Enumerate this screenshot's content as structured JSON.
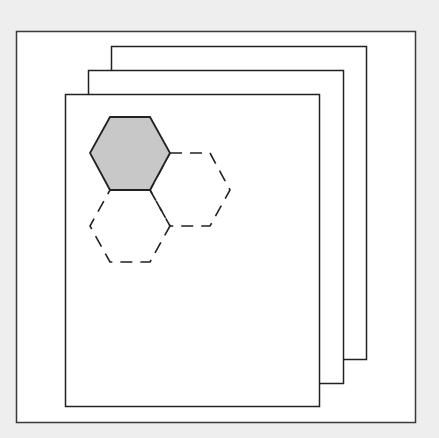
{
  "illustration": {
    "subject": "stacked-pages-with-hexagon-pattern",
    "colors": {
      "background": "#eeeeee",
      "paper": "#ffffff",
      "stroke": "#2a2a2a",
      "hex_fill": "#c8c8c8"
    },
    "frame": {
      "x": 16,
      "y": 31,
      "width": 399,
      "height": 391
    },
    "pages": [
      {
        "name": "back",
        "x": 111,
        "y": 46,
        "width": 255,
        "height": 313
      },
      {
        "name": "middle",
        "x": 88,
        "y": 70,
        "width": 255,
        "height": 313
      },
      {
        "name": "front",
        "x": 65,
        "y": 94,
        "width": 254,
        "height": 312
      }
    ],
    "hexagons": [
      {
        "name": "filled",
        "style": "solid",
        "points": "110,117 150,117 170,153 150,190 110,190 90,153"
      },
      {
        "name": "right",
        "style": "dashed",
        "points": "170,153 210,153 230,190 210,226 170,226 150,190"
      },
      {
        "name": "bottom",
        "style": "dashed",
        "points": "110,190 150,190 170,226 150,262 110,262 90,226"
      }
    ]
  }
}
